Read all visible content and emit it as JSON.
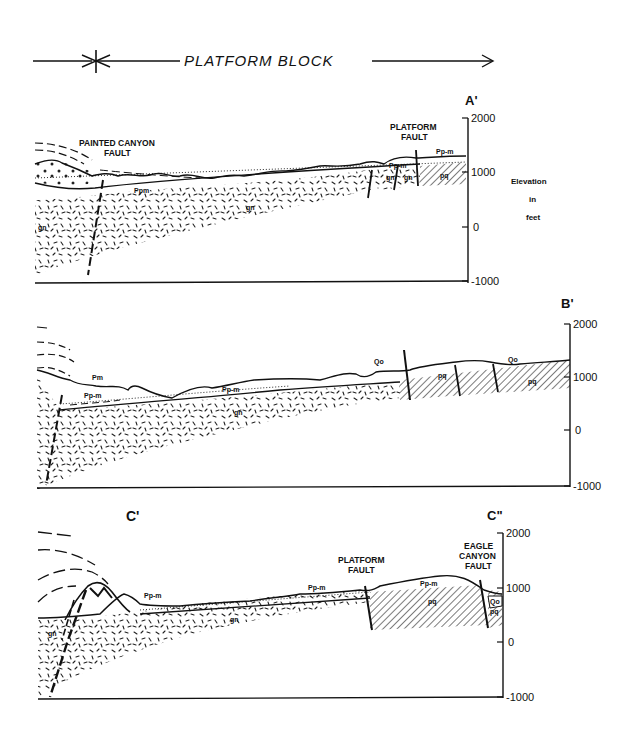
{
  "title": {
    "label": "PLATFORM BLOCK"
  },
  "sections": [
    {
      "id": "A",
      "end_label": "A'",
      "faults": [
        {
          "label_line1": "PAINTED CANYON",
          "label_line2": "FAULT"
        },
        {
          "label_line1": "PLATFORM",
          "label_line2": "FAULT"
        }
      ],
      "unit_labels": [
        "Ppm",
        "gn",
        "gn",
        "gn",
        "gn",
        "Pp-m",
        "Pp-m",
        "pq"
      ],
      "axis": {
        "ticks": [
          "2000",
          "1000",
          "0",
          "-1000"
        ]
      },
      "axis_title": {
        "line1": "Elevation",
        "line2": "in",
        "line3": "feet"
      }
    },
    {
      "id": "B",
      "end_label": "B'",
      "unit_labels": [
        "Pm",
        "Pp-m",
        "Pp-m",
        "gn",
        "Qo",
        "Qo",
        "pq",
        "pq"
      ],
      "axis": {
        "ticks": [
          "2000",
          "1000",
          "0",
          "-1000"
        ]
      }
    },
    {
      "id": "C",
      "start_label": "C'",
      "end_label": "C\"",
      "faults": [
        {
          "label_line1": "PLATFORM",
          "label_line2": "FAULT"
        },
        {
          "label_line1": "EAGLE",
          "label_line2": "CANYON",
          "label_line3": "FAULT"
        }
      ],
      "unit_labels": [
        "Pp-m",
        "gn",
        "gn",
        "Pp-m",
        "Pp-m",
        "pq",
        "Qo",
        "pq"
      ],
      "axis": {
        "ticks": [
          "2000",
          "1000",
          "0",
          "-1000"
        ]
      }
    }
  ]
}
